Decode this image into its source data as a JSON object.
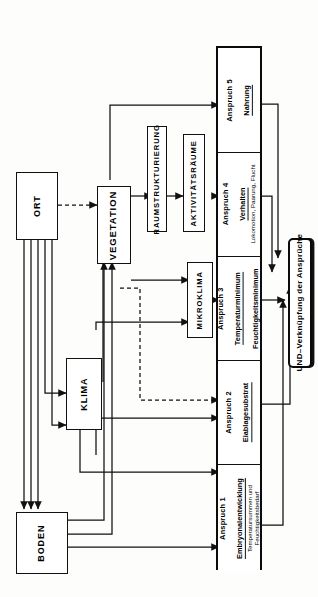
{
  "diagram": {
    "orientation": "rotated-90",
    "colors": {
      "line": "#111111",
      "box_fill": "#ffffff",
      "page": "#fdfdfb"
    },
    "inputs": [
      {
        "id": "ort",
        "label": "ORT"
      },
      {
        "id": "klima",
        "label": "KLIMA"
      },
      {
        "id": "boden",
        "label": "BODEN"
      }
    ],
    "mediators": [
      {
        "id": "vegetation",
        "label": "VEGETATION"
      },
      {
        "id": "raumstrukturierung",
        "label": "RAUMSTRUKTURIERUNG"
      },
      {
        "id": "aktivitaetsraeume",
        "label": "AKTIVITÄTSRÄUME"
      },
      {
        "id": "mikroklima",
        "label": "MIKROKLIMA"
      }
    ],
    "claims": [
      {
        "id": "anspruch-1",
        "number": "Anspruch  1",
        "name": "Embryonalentwicklung",
        "detail": "Temperatursummen und\nFeuchtigkeitsbedarf"
      },
      {
        "id": "anspruch-2",
        "number": "Anspruch  2",
        "name": "Eiablagesubstrat",
        "detail": ""
      },
      {
        "id": "anspruch-3",
        "number": "Anspruch  3",
        "name": "Temperaturminimum",
        "name2": "Feuchtigkeitsminimum",
        "detail": ""
      },
      {
        "id": "anspruch-4",
        "number": "Anspruch  4",
        "name": "Verhalten",
        "detail": "Lokomotion, Paarung, Flucht"
      },
      {
        "id": "anspruch-5",
        "number": "Anspruch  5",
        "name": "Nahrung",
        "detail": ""
      }
    ],
    "aggregator": {
      "id": "und-verknuepfung",
      "label": "UND–Verknüpfung  der  Ansprüche"
    }
  }
}
